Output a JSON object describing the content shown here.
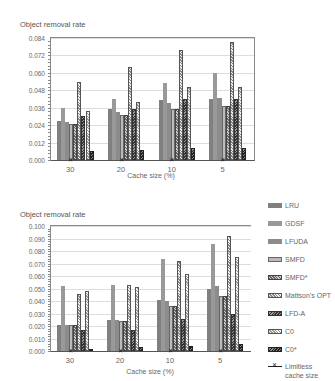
{
  "chart_data": [
    {
      "type": "bar",
      "title": "",
      "ylabel": "Object removal rate",
      "xlabel": "Cache size (%)",
      "categories": [
        "30",
        "20",
        "10",
        "5"
      ],
      "ylim": [
        0,
        0.084
      ],
      "yticks": [
        "0.000",
        "0.012",
        "0.024",
        "0.036",
        "0.048",
        "0.060",
        "0.072",
        "0.084"
      ],
      "grid": true,
      "series": [
        {
          "name": "LRU",
          "values": [
            0.027,
            0.035,
            0.041,
            0.042
          ]
        },
        {
          "name": "GDSF",
          "values": [
            0.036,
            0.042,
            0.053,
            0.06
          ]
        },
        {
          "name": "LFUDA",
          "values": [
            0.026,
            0.033,
            0.039,
            0.043
          ]
        },
        {
          "name": "SMFD",
          "values": [
            0.025,
            0.031,
            0.035,
            0.037
          ]
        },
        {
          "name": "SMFD*",
          "values": [
            0.025,
            0.031,
            0.035,
            0.037
          ]
        },
        {
          "name": "Mattson's OPT",
          "values": [
            0.054,
            0.064,
            0.076,
            0.081
          ]
        },
        {
          "name": "LFD-A",
          "values": [
            0.03,
            0.035,
            0.042,
            0.042
          ]
        },
        {
          "name": "C0",
          "values": [
            0.034,
            0.04,
            0.05,
            0.05
          ]
        },
        {
          "name": "C0*",
          "values": [
            0.006,
            0.007,
            0.008,
            0.008
          ]
        },
        {
          "name": "Limitless cache size",
          "values": [
            0.0,
            0.0,
            0.0,
            0.0
          ]
        }
      ]
    },
    {
      "type": "bar",
      "title": "",
      "ylabel": "Object removal rate",
      "xlabel": "Cache size (%)",
      "categories": [
        "30",
        "20",
        "10",
        "5"
      ],
      "ylim": [
        0,
        0.1
      ],
      "yticks": [
        "0.000",
        "0.010",
        "0.020",
        "0.030",
        "0.040",
        "0.050",
        "0.060",
        "0.070",
        "0.080",
        "0.090",
        "0.100"
      ],
      "grid": true,
      "legend_position": "right",
      "series": [
        {
          "name": "LRU",
          "values": [
            0.021,
            0.025,
            0.041,
            0.05
          ]
        },
        {
          "name": "GDSF",
          "values": [
            0.052,
            0.053,
            0.074,
            0.086
          ]
        },
        {
          "name": "LFUDA",
          "values": [
            0.021,
            0.025,
            0.04,
            0.052
          ]
        },
        {
          "name": "SMFD",
          "values": [
            0.021,
            0.024,
            0.036,
            0.044
          ]
        },
        {
          "name": "SMFD*",
          "values": [
            0.021,
            0.024,
            0.036,
            0.044
          ]
        },
        {
          "name": "Mattson's OPT",
          "values": [
            0.046,
            0.053,
            0.072,
            0.092
          ]
        },
        {
          "name": "LFD-A",
          "values": [
            0.017,
            0.017,
            0.026,
            0.03
          ]
        },
        {
          "name": "C0",
          "values": [
            0.048,
            0.051,
            0.062,
            0.075
          ]
        },
        {
          "name": "C0*",
          "values": [
            0.002,
            0.003,
            0.004,
            0.006
          ]
        },
        {
          "name": "Limitless cache size",
          "values": [
            0.0,
            0.0,
            0.0,
            0.0
          ]
        }
      ]
    }
  ],
  "legend": {
    "items": [
      "LRU",
      "GDSF",
      "LFUDA",
      "SMFD",
      "SMFD*",
      "Mattson's OPT",
      "LFD-A",
      "C0",
      "C0*"
    ],
    "line_item": "Limitless cache size"
  }
}
